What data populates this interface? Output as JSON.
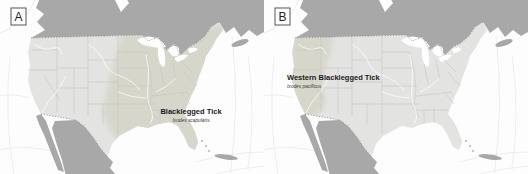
{
  "figure": {
    "panels": [
      {
        "letter": "A",
        "title": "Blacklegged Tick",
        "scientific_name": "Ixodes scapularis"
      },
      {
        "letter": "B",
        "title": "Western Blacklegged Tick",
        "scientific_name": "Ixodes pacificus"
      }
    ]
  },
  "colors": {
    "ocean": "#fdfdfd",
    "canada_mexico": "#a8a8a8",
    "us_land": "#e3e3e1",
    "range": "#d5d5c9",
    "water": "#ffffff",
    "stateline": "#c6c6c4",
    "natborder": "#8a8a8a",
    "graticule": "#e7e7e7"
  }
}
